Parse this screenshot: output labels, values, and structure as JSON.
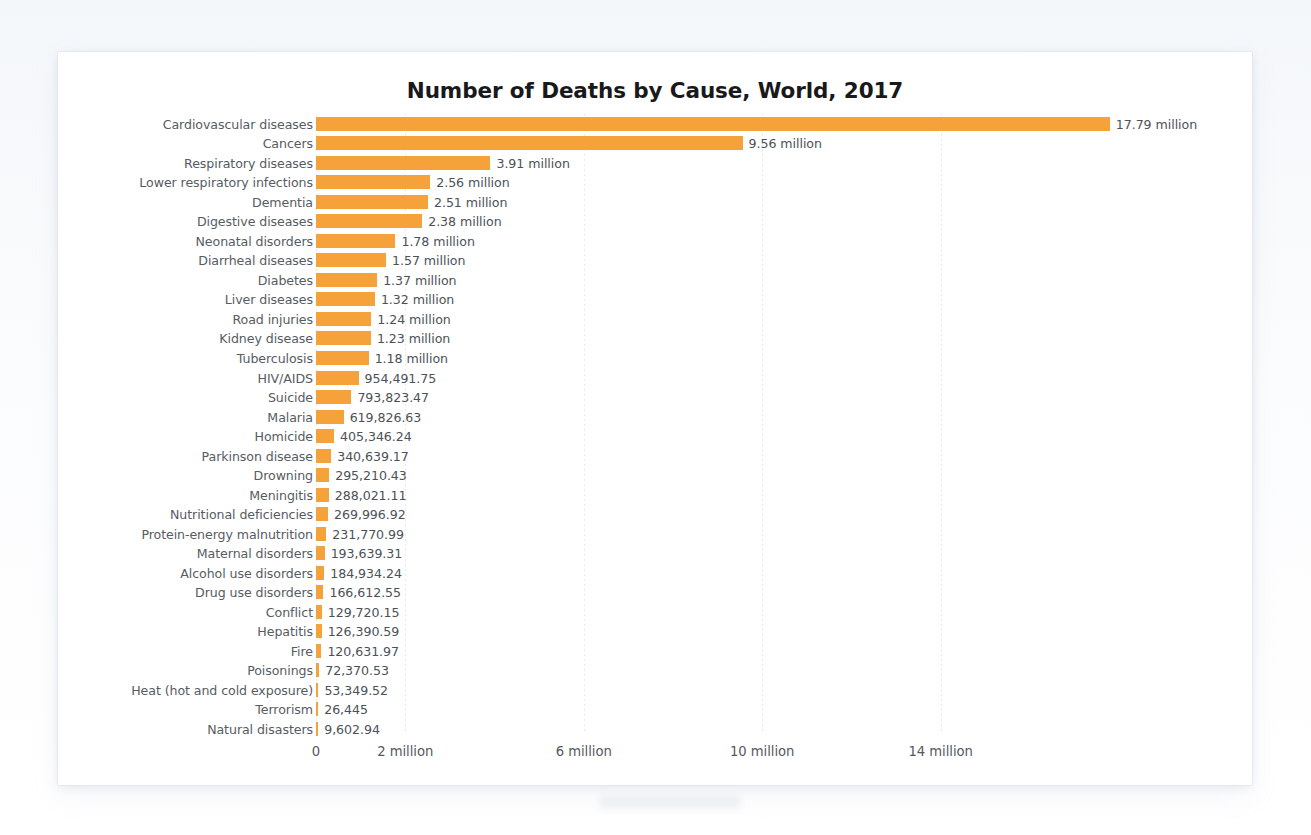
{
  "chart_data": {
    "type": "bar",
    "orientation": "horizontal",
    "title": "Number of Deaths by Cause, World, 2017",
    "xlabel": "",
    "ylabel": "",
    "xlim": [
      0,
      17.79
    ],
    "grid": true,
    "legend": "none",
    "bar_color": "#f5a23a",
    "tick_values": [
      0,
      2,
      6,
      10,
      14
    ],
    "tick_labels": [
      "0",
      "2 million",
      "6 million",
      "10 million",
      "14 million"
    ],
    "units": "deaths",
    "categories": [
      "Cardiovascular diseases",
      "Cancers",
      "Respiratory diseases",
      "Lower respiratory infections",
      "Dementia",
      "Digestive diseases",
      "Neonatal disorders",
      "Diarrheal diseases",
      "Diabetes",
      "Liver diseases",
      "Road injuries",
      "Kidney disease",
      "Tuberculosis",
      "HIV/AIDS",
      "Suicide",
      "Malaria",
      "Homicide",
      "Parkinson disease",
      "Drowning",
      "Meningitis",
      "Nutritional deficiencies",
      "Protein-energy malnutrition",
      "Maternal disorders",
      "Alcohol use disorders",
      "Drug use disorders",
      "Conflict",
      "Hepatitis",
      "Fire",
      "Poisonings",
      "Heat (hot and cold exposure)",
      "Terrorism",
      "Natural disasters"
    ],
    "values": [
      17790000,
      9560000,
      3910000,
      2560000,
      2510000,
      2380000,
      1780000,
      1570000,
      1370000,
      1320000,
      1240000,
      1230000,
      1180000,
      954491.75,
      793823.47,
      619826.63,
      405346.24,
      340639.17,
      295210.43,
      288021.11,
      269996.92,
      231770.99,
      193639.31,
      184934.24,
      166612.55,
      129720.15,
      126390.59,
      120631.97,
      72370.53,
      53349.52,
      26445,
      9602.94
    ],
    "value_labels": [
      "17.79 million",
      "9.56 million",
      "3.91 million",
      "2.56 million",
      "2.51 million",
      "2.38 million",
      "1.78 million",
      "1.57 million",
      "1.37 million",
      "1.32 million",
      "1.24 million",
      "1.23 million",
      "1.18 million",
      "954,491.75",
      "793,823.47",
      "619,826.63",
      "405,346.24",
      "340,639.17",
      "295,210.43",
      "288,021.11",
      "269,996.92",
      "231,770.99",
      "193,639.31",
      "184,934.24",
      "166,612.55",
      "129,720.15",
      "126,390.59",
      "120,631.97",
      "72,370.53",
      "53,349.52",
      "26,445",
      "9,602.94"
    ]
  }
}
